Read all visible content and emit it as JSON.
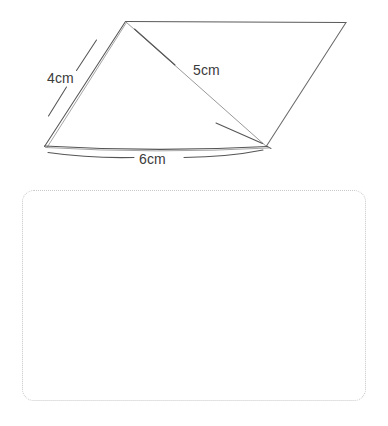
{
  "page": {
    "background_color": "#ffffff",
    "width": 388,
    "height": 426
  },
  "figure": {
    "name": "triangular-prism-net-sketch",
    "stroke_color": "#4a4a4a",
    "light_stroke_color": "#9a9a9a",
    "labels": {
      "side_left": "4cm",
      "side_diagonal": "5cm",
      "side_bottom": "6cm"
    },
    "vertices": {
      "apex": [
        125,
        21
      ],
      "top_right": [
        346,
        22
      ],
      "bottom_left": [
        44,
        146
      ],
      "bottom_right": [
        266,
        146
      ]
    }
  },
  "answer_area": {
    "name": "answer-box",
    "border_style": "dotted",
    "border_color": "#c8c8c8",
    "content": ""
  }
}
